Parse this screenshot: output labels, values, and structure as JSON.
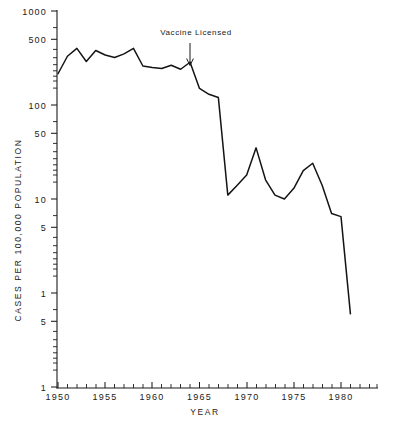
{
  "chart_data": {
    "type": "line",
    "title": "",
    "xlabel": "YEAR",
    "ylabel": "CASES PER 100,000 POPULATION",
    "yscale": "log",
    "ylim": [
      0.1,
      1000
    ],
    "xlim": [
      1950,
      1982
    ],
    "grid": false,
    "legend": null,
    "y_tick_labels": [
      "1000",
      "500",
      "100",
      "50",
      "10",
      "5",
      "1",
      "5",
      "1"
    ],
    "y_tick_values": [
      1000,
      500,
      100,
      50,
      10,
      5,
      1,
      0.5,
      0.1
    ],
    "x_tick_labels": [
      "1950",
      "1955",
      "1960",
      "1965",
      "1970",
      "1975",
      "1980"
    ],
    "x_tick_values": [
      1950,
      1955,
      1960,
      1965,
      1970,
      1975,
      1980
    ],
    "x_minor_interval": 1,
    "series": [
      {
        "name": "Measles cases per 100,000 population",
        "x": [
          1950,
          1951,
          1952,
          1953,
          1954,
          1955,
          1956,
          1957,
          1958,
          1959,
          1960,
          1961,
          1962,
          1963,
          1964,
          1965,
          1966,
          1967,
          1968,
          1969,
          1970,
          1971,
          1972,
          1973,
          1974,
          1975,
          1976,
          1977,
          1978,
          1979,
          1980,
          1981
        ],
        "values": [
          215,
          330,
          400,
          290,
          380,
          340,
          320,
          350,
          400,
          260,
          250,
          245,
          265,
          240,
          285,
          150,
          130,
          120,
          11,
          14,
          18,
          35,
          16,
          11,
          10,
          13,
          20,
          24,
          14,
          7,
          6.5,
          0.6
        ]
      }
    ],
    "annotations": [
      {
        "text": "Vaccine Licensed",
        "x": 1964,
        "y_text": 800,
        "arrow": "down",
        "points_to_x": 1964
      }
    ]
  },
  "axes": {
    "y_axis_name": "cases-per-100000-population-axis",
    "x_axis_name": "year-axis"
  }
}
